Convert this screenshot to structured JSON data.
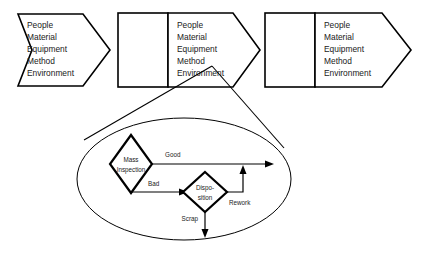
{
  "diagram": {
    "stroke_color": "#000000",
    "fill_color": "#ffffff",
    "text_color": "#1a1a1a",
    "process_segments": [
      {
        "id": "segment-1",
        "arrow_label_lines": [
          "People",
          "Material",
          "Equipment",
          "Method",
          "Environment"
        ],
        "has_box": false
      },
      {
        "id": "segment-2",
        "arrow_label_lines": [
          "People",
          "Material",
          "Equipment",
          "Method",
          "Environment"
        ],
        "has_box": true
      },
      {
        "id": "segment-3",
        "arrow_label_lines": [
          "People",
          "Material",
          "Equipment",
          "Method",
          "Environment"
        ],
        "has_box": true
      }
    ],
    "detail_callout": {
      "shape": "ellipse",
      "nodes": [
        {
          "id": "mass-inspection",
          "shape": "diamond",
          "label_lines": [
            "Mass",
            "Inspection"
          ]
        },
        {
          "id": "disposition",
          "shape": "diamond",
          "label_lines": [
            "Dispo-",
            "sition"
          ]
        }
      ],
      "edges": [
        {
          "id": "edge-good",
          "label": "Good",
          "from": "mass-inspection",
          "to": "output"
        },
        {
          "id": "edge-bad",
          "label": "Bad",
          "from": "mass-inspection",
          "to": "disposition"
        },
        {
          "id": "edge-rework",
          "label": "Rework",
          "from": "disposition",
          "to": "output"
        },
        {
          "id": "edge-scrap",
          "label": "Scrap",
          "from": "disposition",
          "to": "scrap-exit"
        }
      ]
    }
  }
}
